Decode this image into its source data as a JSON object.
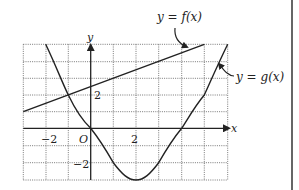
{
  "diagram": {
    "type": "function-graph",
    "x_axis_label": "x",
    "y_axis_label": "y",
    "origin_label": "O",
    "x_tick_labels": [
      {
        "value": -2,
        "text": "−2"
      },
      {
        "value": 2,
        "text": "2"
      }
    ],
    "y_tick_labels": [
      {
        "value": 2,
        "text": "2"
      },
      {
        "value": -2,
        "text": "−2"
      }
    ],
    "x_range": [
      -3,
      6
    ],
    "y_range": [
      -3,
      5
    ],
    "grid": "dotted, 1 unit spacing",
    "curves": [
      {
        "name": "f",
        "label": "y = f(x)",
        "kind": "line",
        "points": [
          [
            -3,
            1
          ],
          [
            5,
            5
          ]
        ]
      },
      {
        "name": "g",
        "label": "y = g(x)",
        "kind": "curve",
        "points": [
          [
            -2,
            5
          ],
          [
            -1,
            2
          ],
          [
            0,
            0
          ],
          [
            1,
            -2
          ],
          [
            2,
            -3
          ],
          [
            3,
            -2
          ],
          [
            4,
            0
          ],
          [
            5,
            2
          ],
          [
            6,
            5
          ]
        ]
      }
    ]
  },
  "labels": {
    "f_label": "y = f(x)",
    "g_label": "y = g(x)",
    "x": "x",
    "y": "y",
    "origin": "O",
    "x_neg2": "−2",
    "x_pos2": "2",
    "y_pos2": "2",
    "y_neg2": "−2"
  },
  "colors": {
    "ink": "#222222",
    "grid": "#555555",
    "border": "#333333"
  }
}
